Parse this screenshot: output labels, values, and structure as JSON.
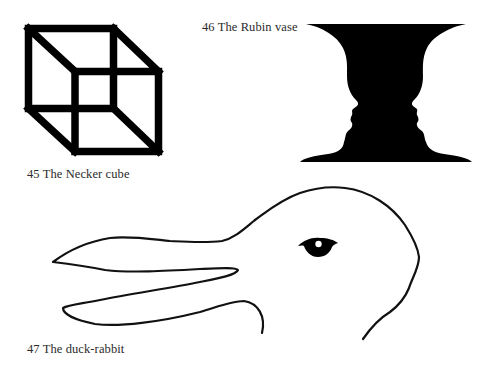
{
  "page": {
    "background": "#ffffff",
    "ink_color": "#000000",
    "caption_color": "#2a2a2a"
  },
  "figures": [
    {
      "number": "45",
      "caption": "45 The Necker cube",
      "subject": "necker-cube"
    },
    {
      "number": "46",
      "caption": "46 The Rubin vase",
      "subject": "rubin-vase"
    },
    {
      "number": "47",
      "caption": "47 The duck-rabbit",
      "subject": "duck-rabbit"
    }
  ]
}
